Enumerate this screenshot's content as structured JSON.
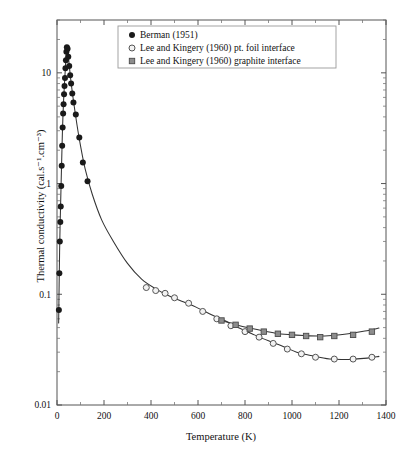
{
  "chart_data": {
    "type": "scatter",
    "title": "",
    "xlabel": "Temperature (K)",
    "ylabel": "Thermal conductivity (cal.s⁻¹.cm⁻³)",
    "xlim": [
      0,
      1400
    ],
    "ylim": [
      0.01,
      30
    ],
    "yscale": "log",
    "xscale": "linear",
    "grid": false,
    "xticks": [
      0,
      200,
      400,
      600,
      800,
      1000,
      1200,
      1400
    ],
    "xticklabels": [
      "0",
      "200",
      "400",
      "600",
      "800",
      "1000",
      "1200",
      "1400"
    ],
    "yticks": [
      0.01,
      0.1,
      1,
      10
    ],
    "yticklabels": [
      "0.01",
      "0.1",
      "1",
      "10"
    ],
    "legend_position": "top-center",
    "series": [
      {
        "name": "Berman (1951)",
        "marker": "filled-circle",
        "color": "#1a1a1a",
        "points": [
          [
            8,
            0.072
          ],
          [
            10,
            0.155
          ],
          [
            12,
            0.3
          ],
          [
            14,
            0.45
          ],
          [
            16,
            0.62
          ],
          [
            18,
            0.95
          ],
          [
            20,
            1.45
          ],
          [
            22,
            2.2
          ],
          [
            24,
            3.2
          ],
          [
            26,
            4.3
          ],
          [
            28,
            5.2
          ],
          [
            30,
            6.4
          ],
          [
            32,
            7.6
          ],
          [
            34,
            9.0
          ],
          [
            36,
            11.0
          ],
          [
            38,
            13.0
          ],
          [
            40,
            15.5
          ],
          [
            42,
            17.0
          ],
          [
            45,
            16.5
          ],
          [
            48,
            14.0
          ],
          [
            52,
            11.5
          ],
          [
            56,
            9.5
          ],
          [
            60,
            8.0
          ],
          [
            65,
            6.5
          ],
          [
            70,
            5.4
          ],
          [
            80,
            4.2
          ],
          [
            95,
            2.6
          ],
          [
            110,
            1.55
          ],
          [
            130,
            1.05
          ]
        ]
      },
      {
        "name": "Lee and Kingery (1960) pt. foil interface",
        "marker": "open-circle",
        "color": "#555555",
        "points": [
          [
            380,
            0.115
          ],
          [
            420,
            0.108
          ],
          [
            460,
            0.102
          ],
          [
            500,
            0.093
          ],
          [
            560,
            0.083
          ],
          [
            620,
            0.07
          ],
          [
            680,
            0.06
          ],
          [
            740,
            0.052
          ],
          [
            800,
            0.046
          ],
          [
            860,
            0.041
          ],
          [
            920,
            0.036
          ],
          [
            980,
            0.032
          ],
          [
            1040,
            0.029
          ],
          [
            1100,
            0.027
          ],
          [
            1180,
            0.026
          ],
          [
            1260,
            0.026
          ],
          [
            1340,
            0.027
          ]
        ]
      },
      {
        "name": "Lee and Kingery (1960) graphite interface",
        "marker": "filled-square",
        "color": "#8d8d8d",
        "points": [
          [
            700,
            0.058
          ],
          [
            760,
            0.053
          ],
          [
            820,
            0.049
          ],
          [
            880,
            0.046
          ],
          [
            940,
            0.044
          ],
          [
            1000,
            0.043
          ],
          [
            1060,
            0.042
          ],
          [
            1120,
            0.041
          ],
          [
            1180,
            0.042
          ],
          [
            1260,
            0.043
          ],
          [
            1340,
            0.046
          ]
        ]
      }
    ],
    "fit_curves": [
      {
        "name": "berman-fit",
        "points": [
          [
            7,
            0.055
          ],
          [
            9,
            0.12
          ],
          [
            11,
            0.24
          ],
          [
            13,
            0.4
          ],
          [
            15,
            0.6
          ],
          [
            17,
            0.9
          ],
          [
            19,
            1.35
          ],
          [
            21,
            2.0
          ],
          [
            23,
            2.9
          ],
          [
            25,
            3.9
          ],
          [
            27,
            5.0
          ],
          [
            29,
            6.2
          ],
          [
            31,
            7.4
          ],
          [
            33,
            8.8
          ],
          [
            35,
            10.5
          ],
          [
            37,
            12.5
          ],
          [
            39,
            14.5
          ],
          [
            41,
            16.2
          ],
          [
            43,
            17.2
          ],
          [
            46,
            16.0
          ],
          [
            50,
            13.0
          ],
          [
            55,
            10.2
          ],
          [
            60,
            8.2
          ],
          [
            70,
            5.6
          ],
          [
            85,
            3.4
          ],
          [
            100,
            2.2
          ],
          [
            120,
            1.35
          ],
          [
            150,
            0.8
          ],
          [
            190,
            0.47
          ],
          [
            240,
            0.3
          ],
          [
            300,
            0.19
          ],
          [
            360,
            0.137
          ],
          [
            420,
            0.112
          ],
          [
            480,
            0.096
          ],
          [
            540,
            0.085
          ],
          [
            600,
            0.075
          ],
          [
            660,
            0.065
          ],
          [
            720,
            0.057
          ],
          [
            780,
            0.049
          ],
          [
            840,
            0.043
          ],
          [
            900,
            0.038
          ],
          [
            960,
            0.034
          ],
          [
            1020,
            0.03
          ],
          [
            1080,
            0.028
          ],
          [
            1160,
            0.026
          ],
          [
            1240,
            0.0258
          ],
          [
            1320,
            0.0265
          ],
          [
            1370,
            0.0275
          ]
        ]
      },
      {
        "name": "graphite-fit",
        "points": [
          [
            690,
            0.059
          ],
          [
            750,
            0.054
          ],
          [
            810,
            0.05
          ],
          [
            870,
            0.047
          ],
          [
            930,
            0.0445
          ],
          [
            990,
            0.0432
          ],
          [
            1050,
            0.0424
          ],
          [
            1110,
            0.042
          ],
          [
            1170,
            0.0425
          ],
          [
            1240,
            0.044
          ],
          [
            1310,
            0.0465
          ],
          [
            1370,
            0.0495
          ]
        ]
      }
    ]
  }
}
